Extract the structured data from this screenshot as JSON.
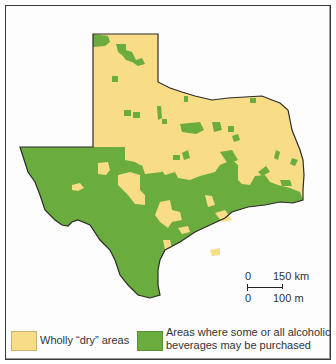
{
  "map": {
    "subject": "Texas dry and wet areas",
    "colors": {
      "dry": "#f8dc86",
      "wet": "#6aac3e",
      "outline": "#2b2b2b",
      "background": "#ffffff"
    }
  },
  "scale_bar": {
    "km_zero": "0",
    "km_label": "150 km",
    "mi_zero": "0",
    "mi_label": "100 m"
  },
  "legend": {
    "items": [
      {
        "label": "Wholly “dry”  areas",
        "color": "#f8dc86"
      },
      {
        "label": "Areas where some or all alcoholic beverages may be purchased",
        "color": "#6aac3e"
      }
    ]
  }
}
